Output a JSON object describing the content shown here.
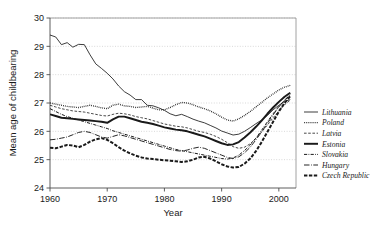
{
  "chart_data": {
    "type": "line",
    "title": "",
    "xlabel": "Year",
    "ylabel": "Mean age of childbearing",
    "xlim": [
      1960,
      2003
    ],
    "ylim": [
      24,
      30
    ],
    "xticks": [
      1960,
      1970,
      1980,
      1990,
      2000
    ],
    "yticks": [
      24,
      25,
      26,
      27,
      28,
      29,
      30
    ],
    "grid": true,
    "grid_axis": "y",
    "legend_position": "right",
    "x": [
      1960,
      1961,
      1962,
      1963,
      1964,
      1965,
      1966,
      1967,
      1968,
      1969,
      1970,
      1971,
      1972,
      1973,
      1974,
      1975,
      1976,
      1977,
      1978,
      1979,
      1980,
      1981,
      1982,
      1983,
      1984,
      1985,
      1986,
      1987,
      1988,
      1989,
      1990,
      1991,
      1992,
      1993,
      1994,
      1995,
      1996,
      1997,
      1998,
      1999,
      2000,
      2001,
      2002
    ],
    "series": [
      {
        "name": "Lithuania",
        "style": "solid-thin",
        "values": [
          29.4,
          29.33,
          29.06,
          29.13,
          28.97,
          29.07,
          29.06,
          28.7,
          28.38,
          28.22,
          28.05,
          27.85,
          27.6,
          27.4,
          27.28,
          27.12,
          27.12,
          26.92,
          26.9,
          26.83,
          26.74,
          26.62,
          26.55,
          26.6,
          26.52,
          26.43,
          26.36,
          26.3,
          26.21,
          26.12,
          26.01,
          25.94,
          25.87,
          25.9,
          26.0,
          26.13,
          26.27,
          26.4,
          26.56,
          26.76,
          26.92,
          27.05,
          27.12
        ]
      },
      {
        "name": "Poland",
        "style": "dotted",
        "values": [
          27.0,
          26.96,
          26.92,
          26.88,
          26.86,
          26.84,
          26.88,
          26.92,
          26.88,
          26.83,
          26.8,
          26.92,
          26.96,
          26.9,
          26.88,
          26.84,
          26.86,
          26.88,
          26.82,
          26.76,
          26.76,
          26.84,
          26.94,
          27.02,
          27.0,
          26.94,
          26.86,
          26.8,
          26.72,
          26.62,
          26.5,
          26.4,
          26.36,
          26.44,
          26.56,
          26.7,
          26.86,
          27.02,
          27.18,
          27.32,
          27.46,
          27.56,
          27.62
        ]
      },
      {
        "name": "Latvia",
        "style": "dashed-thin",
        "values": [
          26.92,
          26.86,
          26.8,
          26.76,
          26.72,
          26.7,
          26.68,
          26.64,
          26.6,
          26.56,
          26.54,
          26.6,
          26.64,
          26.62,
          26.58,
          26.52,
          26.48,
          26.44,
          26.38,
          26.32,
          26.26,
          26.22,
          26.18,
          26.16,
          26.12,
          26.06,
          26.0,
          25.96,
          25.9,
          25.82,
          25.72,
          25.6,
          25.46,
          25.4,
          25.44,
          25.56,
          25.76,
          25.98,
          26.22,
          26.48,
          26.72,
          26.94,
          27.1
        ]
      },
      {
        "name": "Estonia",
        "style": "solid-thick",
        "values": [
          26.6,
          26.54,
          26.48,
          26.46,
          26.44,
          26.42,
          26.4,
          26.38,
          26.36,
          26.34,
          26.3,
          26.42,
          26.52,
          26.52,
          26.46,
          26.4,
          26.34,
          26.3,
          26.26,
          26.2,
          26.14,
          26.1,
          26.06,
          26.04,
          26.0,
          25.94,
          25.88,
          25.82,
          25.74,
          25.66,
          25.58,
          25.52,
          25.54,
          25.62,
          25.78,
          25.96,
          26.16,
          26.38,
          26.62,
          26.84,
          27.04,
          27.22,
          27.36
        ]
      },
      {
        "name": "Slovakia",
        "style": "dashdot-thin",
        "values": [
          26.8,
          26.7,
          26.6,
          26.52,
          26.46,
          26.4,
          26.34,
          26.28,
          26.22,
          26.16,
          26.1,
          26.02,
          25.96,
          25.9,
          25.84,
          25.78,
          25.72,
          25.66,
          25.6,
          25.54,
          25.48,
          25.42,
          25.36,
          25.32,
          25.28,
          25.24,
          25.2,
          25.16,
          25.12,
          25.08,
          25.04,
          25.02,
          25.06,
          25.16,
          25.32,
          25.52,
          25.76,
          26.04,
          26.34,
          26.62,
          26.88,
          27.1,
          27.28
        ]
      },
      {
        "name": "Hungary",
        "style": "longdashdot",
        "values": [
          25.7,
          25.72,
          25.76,
          25.8,
          25.88,
          25.96,
          26.0,
          25.96,
          25.88,
          25.8,
          25.76,
          25.82,
          25.88,
          25.84,
          25.78,
          25.72,
          25.66,
          25.6,
          25.54,
          25.48,
          25.42,
          25.36,
          25.32,
          25.3,
          25.34,
          25.4,
          25.44,
          25.4,
          25.32,
          25.24,
          25.16,
          25.08,
          25.04,
          25.1,
          25.24,
          25.44,
          25.7,
          25.98,
          26.28,
          26.58,
          26.86,
          27.1,
          27.3
        ]
      },
      {
        "name": "Czech Republic",
        "style": "dashed-thick",
        "values": [
          25.42,
          25.4,
          25.46,
          25.52,
          25.5,
          25.44,
          25.52,
          25.64,
          25.72,
          25.76,
          25.7,
          25.58,
          25.44,
          25.32,
          25.22,
          25.14,
          25.08,
          25.04,
          25.02,
          25.0,
          24.98,
          24.96,
          24.94,
          24.92,
          24.94,
          25.0,
          25.08,
          25.1,
          25.04,
          24.94,
          24.84,
          24.76,
          24.72,
          24.74,
          24.86,
          25.04,
          25.3,
          25.62,
          25.98,
          26.34,
          26.7,
          27.0,
          27.24
        ]
      }
    ]
  },
  "legend": {
    "items": [
      {
        "label": "Lithuania",
        "style": "solid-thin"
      },
      {
        "label": "Poland",
        "style": "dotted"
      },
      {
        "label": "Latvia",
        "style": "dashed-thin"
      },
      {
        "label": "Estonia",
        "style": "solid-thick"
      },
      {
        "label": "Slovakia",
        "style": "dashdot-thin"
      },
      {
        "label": "Hungary",
        "style": "longdashdot"
      },
      {
        "label": "Czech Republic",
        "style": "dashed-thick"
      }
    ]
  },
  "axes": {
    "x_title": "Year",
    "y_title": "Mean age of childbearing",
    "x_tick_labels": [
      "1960",
      "1970",
      "1980",
      "1990",
      "2000"
    ],
    "y_tick_labels": [
      "24",
      "25",
      "26",
      "27",
      "28",
      "29",
      "30"
    ]
  },
  "colors": {
    "line": "#1a1a1a",
    "grid": "#c8c8c8",
    "frame": "#8c8c8c",
    "background": "#ffffff"
  }
}
